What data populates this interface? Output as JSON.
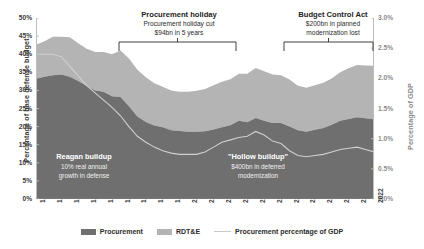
{
  "chart_data": {
    "type": "area",
    "title": "",
    "xlabel": "",
    "ylabel": "Percentage of base defense budget",
    "ylabel_right": "Percentage of GDP",
    "grid": false,
    "legend_position": "bottom",
    "ylim": [
      0,
      50
    ],
    "ylim_right": [
      0.0,
      3.0
    ],
    "yticks": [
      "0%",
      "5%",
      "10%",
      "15%",
      "20%",
      "25%",
      "30%",
      "35%",
      "40%",
      "45%",
      "50%"
    ],
    "yticks_right": [
      "0.0%",
      "0.5%",
      "1.0%",
      "1.5%",
      "2.0%",
      "2.5%",
      "3.0%"
    ],
    "x": [
      1982,
      1983,
      1984,
      1985,
      1986,
      1987,
      1988,
      1989,
      1990,
      1991,
      1992,
      1993,
      1994,
      1995,
      1996,
      1997,
      1998,
      1999,
      2000,
      2001,
      2002,
      2003,
      2004,
      2005,
      2006,
      2007,
      2008,
      2009,
      2010,
      2011,
      2012,
      2013,
      2014,
      2015,
      2016,
      2017,
      2018,
      2019,
      2020,
      2021,
      2022
    ],
    "xticks": [
      "1982",
      "1984",
      "1986",
      "1988",
      "1990",
      "1992",
      "1994",
      "1996",
      "1998",
      "2000",
      "2002",
      "2004",
      "2006",
      "2008",
      "2010",
      "2012",
      "2014",
      "2016",
      "2018",
      "2020",
      "2022"
    ],
    "series": [
      {
        "name": "Procurement",
        "color": "#6f6f6f",
        "axis": "left",
        "unit": "percent of base defense budget",
        "values": [
          33.2,
          33.8,
          34.2,
          34.4,
          33.8,
          32.6,
          31.3,
          30.0,
          29.6,
          28.4,
          28.2,
          25.6,
          22.8,
          21.3,
          20.3,
          19.8,
          19.0,
          18.8,
          18.6,
          18.6,
          18.7,
          19.2,
          19.8,
          20.4,
          21.6,
          21.2,
          22.4,
          21.6,
          21.0,
          21.0,
          20.0,
          19.0,
          18.6,
          19.1,
          19.6,
          20.5,
          21.6,
          22.1,
          22.6,
          22.3,
          22.0
        ]
      },
      {
        "name": "RDT&E",
        "color": "#b4b4b4",
        "axis": "left",
        "unit": "percent of base defense budget",
        "values": [
          9.4,
          9.8,
          10.6,
          10.4,
          10.9,
          10.4,
          10.2,
          10.6,
          11.0,
          11.6,
          12.8,
          13.2,
          12.9,
          12.3,
          11.7,
          11.2,
          11.0,
          10.8,
          11.0,
          11.3,
          11.7,
          12.2,
          12.6,
          12.7,
          13.0,
          13.4,
          13.8,
          13.7,
          13.4,
          13.2,
          13.0,
          12.3,
          12.1,
          12.3,
          12.5,
          12.8,
          13.4,
          14.0,
          14.4,
          14.6,
          14.8
        ]
      },
      {
        "name": "Procurement percentage of GDP",
        "color": "#cfcfcf",
        "axis": "right",
        "unit": "percent of GDP",
        "values": [
          2.4,
          2.4,
          2.4,
          2.36,
          2.2,
          2.04,
          1.88,
          1.76,
          1.64,
          1.52,
          1.38,
          1.2,
          1.04,
          0.94,
          0.86,
          0.8,
          0.76,
          0.74,
          0.74,
          0.74,
          0.78,
          0.86,
          0.94,
          0.98,
          1.02,
          1.04,
          1.12,
          1.06,
          0.96,
          0.92,
          0.8,
          0.72,
          0.7,
          0.72,
          0.74,
          0.78,
          0.82,
          0.84,
          0.86,
          0.82,
          0.78
        ]
      }
    ],
    "stacked_total_note": "Procurement and RDT&E are stacked; line plots on right axis",
    "annotations": [
      {
        "id": "procurement-holiday",
        "heading": "Procurement holiday",
        "lines": [
          "Procurement holiday cut",
          "$94bn in 5 years"
        ],
        "bracket_range": [
          1991,
          2002
        ],
        "placement": "above-plot"
      },
      {
        "id": "budget-control-act",
        "heading": "Budget Control Act",
        "lines": [
          "$200bn in planned",
          "modernization lost"
        ],
        "bracket_range": [
          2011,
          2021
        ],
        "placement": "above-plot"
      },
      {
        "id": "reagan-buildup",
        "heading": "Reagan buildup",
        "lines": [
          "10% real annual",
          "growth in defense"
        ],
        "placement": "inside-plot"
      },
      {
        "id": "hollow-buildup",
        "heading": "\"Hollow buildup\"",
        "lines": [
          "$400bn in deferred",
          "modernization"
        ],
        "placement": "inside-plot"
      }
    ],
    "legend": [
      {
        "label": "Procurement",
        "swatch": "#6f6f6f",
        "kind": "area"
      },
      {
        "label": "RDT&E",
        "swatch": "#b4b4b4",
        "kind": "area"
      },
      {
        "label": "Procurement percentage of GDP",
        "swatch": "#c9c9c9",
        "kind": "line"
      }
    ]
  }
}
